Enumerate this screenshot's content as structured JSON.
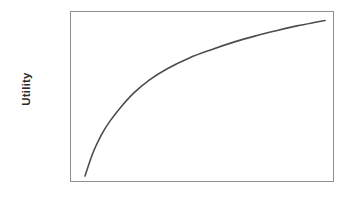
{
  "figure": {
    "background_color": "#ffffff",
    "frame_color": "#8f8f8f",
    "width": 351,
    "height": 199
  },
  "axes": {
    "y_label": "Utility",
    "x_label": "",
    "y_tick_labels": [],
    "x_tick_labels": []
  },
  "chart_data": {
    "type": "line",
    "title": "",
    "xlabel": "",
    "ylabel": "Utility",
    "grid": false,
    "legend": null,
    "legend_position": "none",
    "axis_frame": "box",
    "tick_marks": false,
    "tick_labels": false,
    "xlim": [
      0,
      1
    ],
    "ylim": [
      0,
      1
    ],
    "series": [
      {
        "name": "Utility",
        "color": "#4d4d4d",
        "line_width": 1.6,
        "shape": "concave-down increasing (diminishing marginal utility)",
        "x": [
          0.057,
          0.075,
          0.095,
          0.12,
          0.15,
          0.19,
          0.24,
          0.3,
          0.37,
          0.45,
          0.53,
          0.62,
          0.7,
          0.78,
          0.86,
          0.93,
          0.966
        ],
        "y": [
          0.035,
          0.12,
          0.2,
          0.279,
          0.353,
          0.433,
          0.518,
          0.596,
          0.664,
          0.724,
          0.771,
          0.818,
          0.853,
          0.884,
          0.913,
          0.934,
          0.944
        ]
      }
    ]
  }
}
